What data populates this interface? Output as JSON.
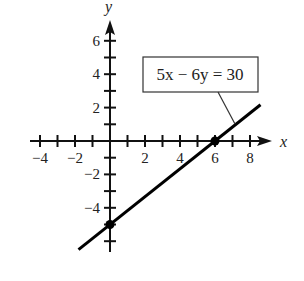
{
  "chart_data": {
    "type": "line",
    "title": "",
    "equation": "5x − 6y = 30",
    "xlabel": "x",
    "ylabel": "y",
    "xlim": [
      -4.5,
      9
    ],
    "ylim": [
      -6,
      7
    ],
    "x_ticks": [
      -4,
      -2,
      2,
      4,
      6,
      8
    ],
    "y_ticks": [
      6,
      4,
      2,
      -2,
      -4
    ],
    "x_tick_labels": [
      "−4",
      "−2",
      "2",
      "4",
      "6",
      "8"
    ],
    "y_tick_labels": [
      "6",
      "4",
      "2",
      "−2",
      "−4"
    ],
    "series": [
      {
        "name": "5x − 6y = 30",
        "x": [
          -1.8,
          8.6
        ],
        "y": [
          -6.5,
          2.17
        ]
      }
    ],
    "points": [
      {
        "label": "x-intercept",
        "x": 6,
        "y": 0
      },
      {
        "label": "y-intercept",
        "x": 0,
        "y": -5
      }
    ],
    "grid": false
  }
}
